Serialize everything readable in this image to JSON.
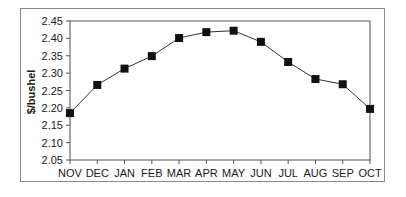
{
  "chart_data": {
    "type": "line",
    "title": "",
    "xlabel": "",
    "ylabel": "$/bushel",
    "categories": [
      "NOV",
      "DEC",
      "JAN",
      "FEB",
      "MAR",
      "APR",
      "MAY",
      "JUN",
      "JUL",
      "AUG",
      "SEP",
      "OCT"
    ],
    "series": [
      {
        "name": "Price",
        "values": [
          2.185,
          2.266,
          2.313,
          2.349,
          2.401,
          2.418,
          2.422,
          2.39,
          2.332,
          2.283,
          2.268,
          2.197
        ],
        "marker": "square",
        "color": "#111111"
      }
    ],
    "yticks": [
      "2.05",
      "2.10",
      "2.15",
      "2.20",
      "2.25",
      "2.30",
      "2.35",
      "2.40",
      "2.45"
    ],
    "ylim": [
      2.05,
      2.45
    ],
    "grid": false,
    "legend": "none"
  },
  "colors": {
    "line": "#333333",
    "marker": "#111111",
    "axis": "#555555",
    "frame": "#8a8a8a"
  }
}
